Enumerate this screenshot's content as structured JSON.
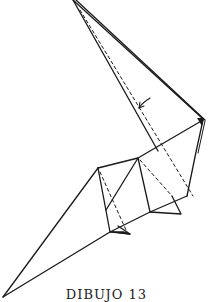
{
  "figure": {
    "caption": "DIBUJO 13",
    "line_color": "#1a1a1a",
    "background": "#ffffff",
    "symbols": {
      "fold_arrow": "curved-arrow-icon",
      "push_marker": "triangle-arrow-icon"
    }
  }
}
